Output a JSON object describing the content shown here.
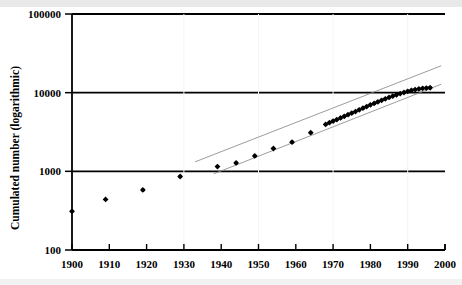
{
  "chart_data": {
    "type": "scatter",
    "title": "",
    "xlabel": "",
    "ylabel": "Cumulated number (logarithmic)",
    "yscale": "log",
    "xlim": [
      1900,
      2000
    ],
    "ylim": [
      100,
      100000
    ],
    "xticks": [
      1900,
      1910,
      1920,
      1930,
      1940,
      1950,
      1960,
      1970,
      1980,
      1990,
      2000
    ],
    "xtick_labels": [
      "1900",
      "1910",
      "1920",
      "1930",
      "1940",
      "1950",
      "1960",
      "1970",
      "1980",
      "1990",
      "2000"
    ],
    "yticks": [
      100,
      1000,
      10000,
      100000
    ],
    "ytick_labels": [
      "100",
      "1000",
      "10000",
      "100000"
    ],
    "grid": "horizontal-major",
    "legend": "none",
    "marker": "filled-diamond",
    "marker_color": "#000000",
    "series": [
      {
        "name": "Cumulated number",
        "x": [
          1900,
          1909,
          1919,
          1929,
          1939,
          1944,
          1949,
          1954,
          1959,
          1964,
          1968,
          1969,
          1970,
          1971,
          1972,
          1973,
          1974,
          1975,
          1976,
          1977,
          1978,
          1979,
          1980,
          1981,
          1982,
          1983,
          1984,
          1985,
          1986,
          1987,
          1988,
          1989,
          1990,
          1991,
          1992,
          1993,
          1994,
          1995,
          1996
        ],
        "values": [
          310,
          440,
          580,
          860,
          1150,
          1280,
          1570,
          1950,
          2350,
          3100,
          3950,
          4150,
          4350,
          4550,
          4780,
          5000,
          5250,
          5500,
          5750,
          6050,
          6350,
          6650,
          7000,
          7300,
          7650,
          8000,
          8350,
          8700,
          9050,
          9400,
          9750,
          10050,
          10400,
          10700,
          10950,
          11150,
          11350,
          11450,
          11550
        ]
      }
    ],
    "trendlines": [
      {
        "name": "upper-trend",
        "style": "thin-solid-gray",
        "x_start": 1933,
        "y_start": 1320,
        "x_end": 1999,
        "y_end": 22000
      },
      {
        "name": "lower-trend",
        "style": "thin-solid-gray",
        "x_start": 1938,
        "y_start": 930,
        "x_end": 1999,
        "y_end": 12800
      }
    ]
  },
  "axes": {
    "y_title": "Cumulated number (logarithmic)"
  }
}
